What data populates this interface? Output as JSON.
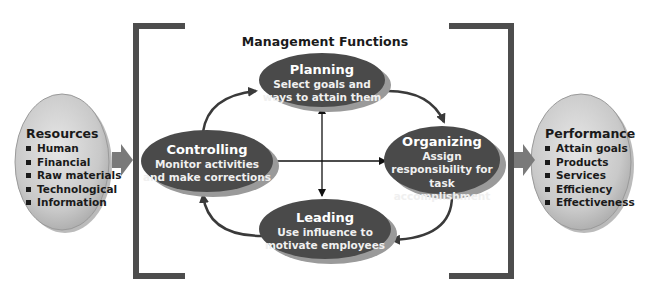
{
  "title": "Management Functions",
  "resources": {
    "heading": "Resources",
    "items": [
      "Human",
      "Financial",
      "Raw materials",
      "Technological",
      "Information"
    ]
  },
  "performance": {
    "heading": "Performance",
    "items": [
      "Attain goals",
      "Products",
      "Services",
      "Efficiency",
      "Effectiveness"
    ]
  },
  "functions": {
    "planning": {
      "label": "Planning",
      "lines": [
        "Select goals and",
        "ways to attain them"
      ]
    },
    "organizing": {
      "label": "Organizing",
      "lines": [
        "Assign",
        "responsibility for task",
        "accomplishment"
      ]
    },
    "leading": {
      "label": "Leading",
      "lines": [
        "Use influence to",
        "motivate employees"
      ]
    },
    "controlling": {
      "label": "Controlling",
      "lines": [
        "Monitor activities",
        "and make corrections"
      ]
    }
  },
  "colors": {
    "ellipse_fill": "#4a4a4a",
    "ellipse_shadow": "#9a9a9a",
    "side_fill": "#c8c8c8",
    "bracket": "#4d4d4d",
    "arrow": "#3a3a3a"
  }
}
